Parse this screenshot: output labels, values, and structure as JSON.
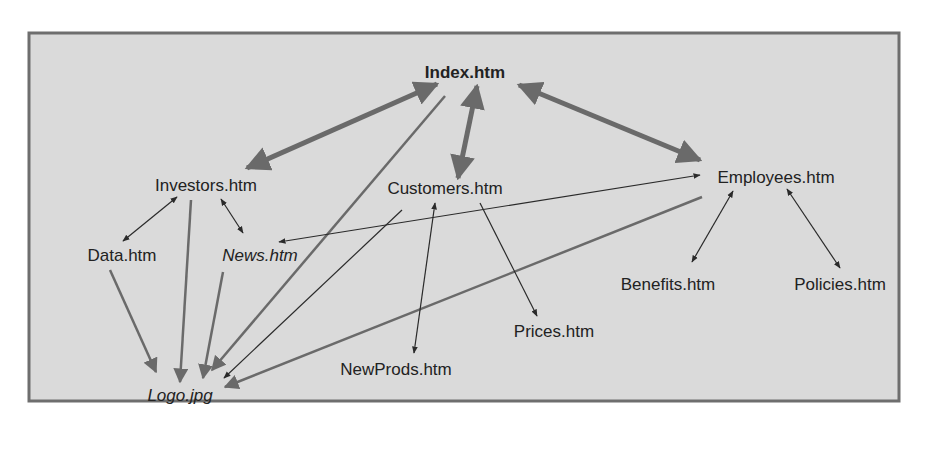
{
  "diagram": {
    "type": "website-link-structure",
    "colors": {
      "frame_fill": "#dadada",
      "frame_border": "#6e6e6e",
      "thick_arrow": "#6a6a6a",
      "thin_arrow": "#2a2a2a",
      "text": "#222222"
    },
    "nodes": {
      "index": "Index.htm",
      "investors": "Investors.htm",
      "customers": "Customers.htm",
      "employees": "Employees.htm",
      "data": "Data.htm",
      "news": "News.htm",
      "benefits": "Benefits.htm",
      "policies": "Policies.htm",
      "prices": "Prices.htm",
      "newprods": "NewProds.htm",
      "logo": "Logo.jpg"
    },
    "edges": [
      {
        "from": "Index.htm",
        "to": "Investors.htm",
        "style": "thick",
        "direction": "both"
      },
      {
        "from": "Index.htm",
        "to": "Customers.htm",
        "style": "thick",
        "direction": "both"
      },
      {
        "from": "Index.htm",
        "to": "Employees.htm",
        "style": "thick",
        "direction": "both"
      },
      {
        "from": "Investors.htm",
        "to": "Data.htm",
        "style": "thin",
        "direction": "both"
      },
      {
        "from": "Investors.htm",
        "to": "News.htm",
        "style": "thin",
        "direction": "both"
      },
      {
        "from": "Customers.htm",
        "to": "NewProds.htm",
        "style": "thin",
        "direction": "both"
      },
      {
        "from": "Customers.htm",
        "to": "Prices.htm",
        "style": "thin",
        "direction": "forward"
      },
      {
        "from": "Employees.htm",
        "to": "Benefits.htm",
        "style": "thin",
        "direction": "both"
      },
      {
        "from": "Employees.htm",
        "to": "Policies.htm",
        "style": "thin",
        "direction": "both"
      },
      {
        "from": "News.htm",
        "to": "Employees.htm",
        "style": "thin",
        "direction": "both"
      },
      {
        "from": "Data.htm",
        "to": "Logo.jpg",
        "style": "medium",
        "direction": "forward"
      },
      {
        "from": "Investors.htm",
        "to": "Logo.jpg",
        "style": "medium",
        "direction": "forward"
      },
      {
        "from": "News.htm",
        "to": "Logo.jpg",
        "style": "medium",
        "direction": "forward"
      },
      {
        "from": "Index.htm",
        "to": "Logo.jpg",
        "style": "medium",
        "direction": "forward"
      },
      {
        "from": "Customers.htm",
        "to": "Logo.jpg",
        "style": "thin",
        "direction": "forward"
      },
      {
        "from": "Employees.htm",
        "to": "Logo.jpg",
        "style": "medium",
        "direction": "forward"
      }
    ]
  }
}
